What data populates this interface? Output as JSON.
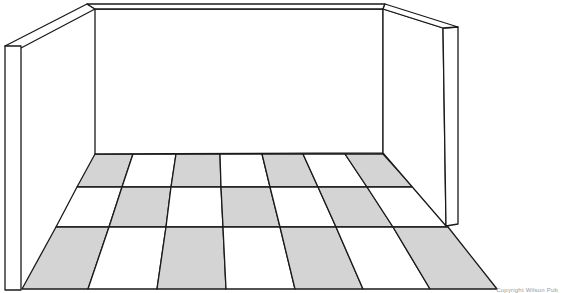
{
  "figure": {
    "credit": "Copyright Wilson Pub"
  },
  "colors": {
    "line": "#1a1a1a",
    "tile_gray": "#d4d4d4",
    "tile_white": "#ffffff",
    "wall": "#ffffff"
  },
  "geometry": {
    "ceiling_left_outer": [
      [
        5,
        46
      ],
      [
        87,
        4
      ],
      [
        95,
        4
      ],
      [
        95,
        9
      ],
      [
        21,
        48
      ],
      [
        5,
        48
      ]
    ],
    "ceiling_right_outer": [
      [
        383,
        4
      ],
      [
        385,
        4
      ],
      [
        458,
        27
      ],
      [
        443,
        28
      ],
      [
        383,
        9
      ]
    ],
    "left_wall_outer": [
      [
        5,
        46
      ],
      [
        21,
        46
      ],
      [
        21,
        290
      ],
      [
        5,
        290
      ]
    ],
    "left_wall_slant": [
      [
        5,
        46
      ],
      [
        87,
        4
      ],
      [
        95,
        9
      ],
      [
        21,
        48
      ]
    ],
    "back_wall": [
      [
        95,
        9
      ],
      [
        383,
        9
      ],
      [
        383,
        153
      ],
      [
        95,
        154
      ]
    ],
    "right_wall_face": [
      [
        383,
        9
      ],
      [
        443,
        28
      ],
      [
        446,
        226
      ],
      [
        383,
        153
      ]
    ],
    "right_wall_edge": [
      [
        443,
        28
      ],
      [
        458,
        27
      ],
      [
        458,
        224
      ],
      [
        446,
        226
      ]
    ],
    "floor_rows_y": [
      154,
      187,
      227,
      289
    ],
    "floor_columns": [
      [
        95,
        77,
        56,
        22
      ],
      [
        133,
        122,
        109,
        88
      ],
      [
        176,
        171,
        166,
        157
      ],
      [
        220,
        221,
        223,
        226
      ],
      [
        262,
        270,
        280,
        295
      ],
      [
        303,
        318,
        336,
        363
      ],
      [
        345,
        367,
        393,
        430
      ],
      [
        383,
        413,
        448,
        497
      ]
    ],
    "checker_start_gray": true
  }
}
